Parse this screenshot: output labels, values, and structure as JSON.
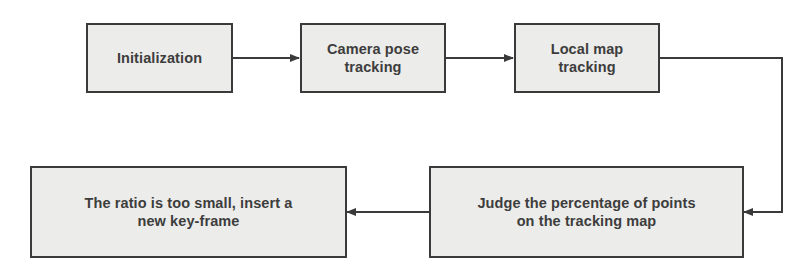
{
  "diagram": {
    "nodes": [
      {
        "id": "init",
        "label": "Initialization"
      },
      {
        "id": "camera",
        "label": "Camera pose\ntracking"
      },
      {
        "id": "localmap",
        "label": "Local map\ntracking"
      },
      {
        "id": "judge",
        "label": "Judge the percentage of points\non the tracking map"
      },
      {
        "id": "keyframe",
        "label": "The ratio is too small, insert a\nnew key-frame"
      }
    ],
    "edges": [
      {
        "from": "init",
        "to": "camera"
      },
      {
        "from": "camera",
        "to": "localmap"
      },
      {
        "from": "localmap",
        "to": "judge"
      },
      {
        "from": "judge",
        "to": "keyframe"
      }
    ],
    "colors": {
      "box_fill": "#ececea",
      "stroke": "#3a3a3a",
      "text": "#3d3d3d"
    }
  }
}
